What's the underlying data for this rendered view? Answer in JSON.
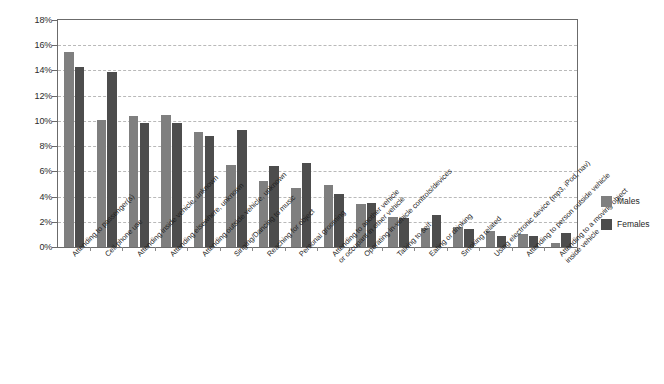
{
  "chart_data": {
    "type": "bar",
    "title": "",
    "subtitle": "",
    "xlabel": "",
    "ylabel": "",
    "ylim": [
      0,
      18
    ],
    "ytick_labels": [
      "0%",
      "2%",
      "4%",
      "6%",
      "8%",
      "10%",
      "12%",
      "14%",
      "16%",
      "18%"
    ],
    "ytick_values": [
      0,
      2,
      4,
      6,
      8,
      10,
      12,
      14,
      16,
      18
    ],
    "grid": "horizontal-dashed",
    "legend_position": "right",
    "categories": [
      "Attending to passenger(s)",
      "Cell phone use",
      "Attending inside vehicle, unknown",
      "Attending elsewhere, unknown",
      "Attending outside vehicle, unknown",
      "Singing/Dancing to music",
      "Reaching for object",
      "Personal grooming",
      "Attending to another vehicle or occupant in other vehicle",
      "Operating in-vehicle controls/devices",
      "Talking to self",
      "Eating or drinking",
      "Smoking related",
      "Using electronic device (mp3, iPod, nav)",
      "Attending to person outside vehicle",
      "Attending to a moving object inside vehicle"
    ],
    "category_lines": [
      [
        "Attending to passenger(s)"
      ],
      [
        "Cell phone use"
      ],
      [
        "Attending inside vehicle, unknown"
      ],
      [
        "Attending elsewhere, unknown"
      ],
      [
        "Attending outside vehicle, unknown"
      ],
      [
        "Singing/Dancing to music"
      ],
      [
        "Reaching for object"
      ],
      [
        "Personal grooming"
      ],
      [
        "Attending to another vehicle",
        "or occupant in other vehicle"
      ],
      [
        "Operating in-vehicle controls/devices"
      ],
      [
        "Talking to self"
      ],
      [
        "Eating or drinking"
      ],
      [
        "Smoking related"
      ],
      [
        "Using electronic device (mp3, iPod, nav)"
      ],
      [
        "Attending to person outside vehicle"
      ],
      [
        "Attending to a moving object",
        "inside vehicle"
      ]
    ],
    "series": [
      {
        "name": "Males",
        "color": "#7f7f7f",
        "values": [
          15.5,
          10.1,
          10.4,
          10.5,
          9.1,
          6.5,
          5.2,
          4.7,
          4.9,
          3.4,
          2.4,
          1.5,
          1.6,
          1.3,
          1.0,
          0.3
        ]
      },
      {
        "name": "Females",
        "color": "#4d4d4d",
        "values": [
          14.3,
          13.9,
          9.8,
          9.8,
          8.8,
          9.3,
          6.4,
          6.7,
          4.2,
          3.5,
          2.3,
          2.5,
          1.4,
          0.9,
          0.9,
          1.1
        ]
      }
    ]
  },
  "legend": {
    "items": [
      {
        "label": "Males",
        "color": "#7f7f7f"
      },
      {
        "label": "Females",
        "color": "#4d4d4d"
      }
    ]
  }
}
